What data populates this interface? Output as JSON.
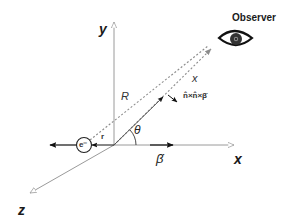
{
  "diagram": {
    "axes": {
      "x_label": "x",
      "y_label": "y",
      "z_label": "z"
    },
    "labels": {
      "observer": "Observer",
      "R": "R",
      "x_vec": "x",
      "r": "r",
      "theta": "θ",
      "beta_dot": "β̇",
      "electron": "e⁻",
      "radiation_direction": "n̂×n̂×β̇"
    },
    "colors": {
      "axis": "#9a9a9a",
      "arrow_fill": "#111111",
      "dashed": "#8c8c8c",
      "text": "#1a1a1a"
    }
  }
}
